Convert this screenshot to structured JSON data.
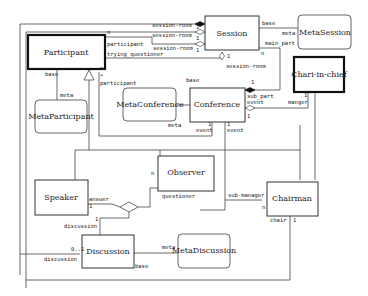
{
  "diagram": {
    "type": "UML class diagram",
    "classes": {
      "participant": "Participant",
      "session": "Session",
      "meta_session": "MetaSession",
      "chari_in_chief": "Chari-in-chief",
      "meta_participant": "MetaParticipant",
      "meta_conference": "MetaConference",
      "conference": "Conference",
      "observer": "Observer",
      "speaker": "Speaker",
      "chairman": "Chairman",
      "discussion": "Discussion",
      "meta_discussion": "MetaDiscussion"
    },
    "roles": {
      "session_room_1": "session-room",
      "session_room_2": "session-room",
      "session_room_3": "session-room",
      "session_room_4": "session-room",
      "n_participant": "n",
      "participant_1": "participant",
      "trying_questioner": "trying_questioner",
      "mult_1a": "1",
      "mult_1b": "1",
      "mult_1c": "1",
      "mult_1d": "1",
      "base_session": "base",
      "meta_session": "meta",
      "main_part": "main_part",
      "n_main": "n",
      "base_participant": "base",
      "meta_participant": "meta",
      "n_star": "n",
      "star": "*",
      "participant_2": "participant",
      "base_conf": "base",
      "meta_conf": "meta",
      "mult_sub": "1",
      "sub_part": "sub_part",
      "event_sub": "event",
      "mult_ev": "1",
      "event_1_mult": "1",
      "event_1": "event",
      "event_2_mult": "1",
      "event_2": "event",
      "manger_mult": "1",
      "manger": "manger",
      "n_obs": "n",
      "questioner": "questioner",
      "sub_manager": "sub-manager",
      "n_chair": "n",
      "chair": "chair",
      "chair_mult": "1",
      "answer": "answer",
      "answer_mult": "1",
      "disc_mult": "1",
      "discussion_1": "discussion",
      "disc_01": "0..1",
      "discussion_2": "discussion",
      "meta_disc": "meta",
      "base_disc": "base"
    }
  }
}
